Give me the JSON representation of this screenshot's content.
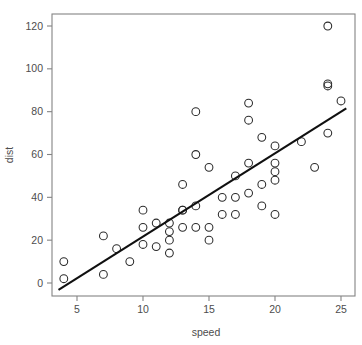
{
  "chart_data": {
    "type": "scatter",
    "title": "",
    "xlabel": "speed",
    "ylabel": "dist",
    "xlim": [
      3.4,
      25.6
    ],
    "ylim": [
      -5,
      126
    ],
    "grid": false,
    "legend": null,
    "xticks": [
      5,
      10,
      15,
      20,
      25
    ],
    "yticks": [
      0,
      20,
      40,
      60,
      80,
      100,
      120
    ],
    "xtick_labels": [
      "5",
      "10",
      "15",
      "20",
      "25"
    ],
    "ytick_labels": [
      "0",
      "20",
      "40",
      "60",
      "80",
      "100",
      "120"
    ],
    "series": [
      {
        "name": "cars",
        "marker": "open-circle",
        "color": "#2b2b2b",
        "x": [
          4,
          4,
          7,
          7,
          8,
          9,
          10,
          10,
          10,
          11,
          11,
          12,
          12,
          12,
          12,
          13,
          13,
          13,
          13,
          14,
          14,
          14,
          14,
          15,
          15,
          15,
          16,
          16,
          17,
          17,
          17,
          18,
          18,
          18,
          18,
          19,
          19,
          19,
          20,
          20,
          20,
          20,
          20,
          22,
          23,
          24,
          24,
          24,
          24,
          25
        ],
        "y": [
          2,
          10,
          4,
          22,
          16,
          10,
          18,
          26,
          34,
          17,
          28,
          14,
          20,
          24,
          28,
          26,
          34,
          34,
          46,
          26,
          36,
          60,
          80,
          20,
          26,
          54,
          32,
          40,
          32,
          40,
          50,
          42,
          56,
          76,
          84,
          36,
          46,
          68,
          32,
          48,
          52,
          56,
          64,
          66,
          54,
          70,
          92,
          93,
          120,
          85
        ]
      }
    ],
    "fit_line": {
      "name": "linear-regression",
      "color": "#101010",
      "x_start": 3.6,
      "y_start": -3.2,
      "x_end": 25.4,
      "y_end": 81.5
    }
  },
  "axes": {
    "x_axis_title": "speed",
    "y_axis_title": "dist"
  }
}
